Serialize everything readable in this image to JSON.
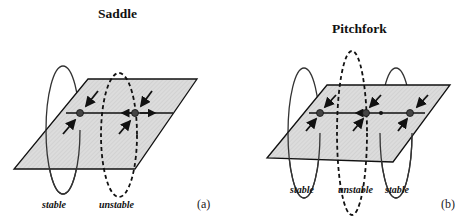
{
  "panels": [
    {
      "id": "a",
      "title": "Saddle",
      "tag": "(a)",
      "labels": [
        "stable",
        "unstable"
      ]
    },
    {
      "id": "b",
      "title": "Pitchfork",
      "tag": "(b)",
      "labels": [
        "stable",
        "unstable",
        "stable"
      ]
    }
  ],
  "colors": {
    "plane_fill": "#d9d9d9",
    "line": "#111111",
    "fixed_point": "#444444"
  }
}
